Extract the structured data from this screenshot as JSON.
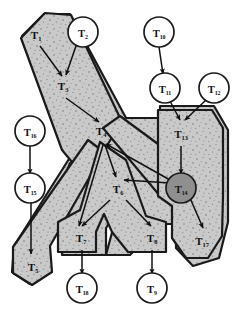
{
  "figure": {
    "type": "node-link-diagram",
    "colors": {
      "polygon_fill": "#c9c9c9",
      "polygon_stroke": "#1a1a1a",
      "highlight_node_fill": "#8f8f8f",
      "circle_fill": "#ffffff",
      "circle_stroke": "#1a1a1a",
      "arrow": "#111111",
      "background": "#ffffff"
    }
  },
  "nodes": [
    {
      "id": "T1",
      "base": "T",
      "sub": "1",
      "kind": "polygon-label",
      "x": 36,
      "y": 34
    },
    {
      "id": "T2",
      "base": "T",
      "sub": "2",
      "kind": "circle",
      "x": 83,
      "y": 32,
      "r": 15
    },
    {
      "id": "T3",
      "base": "T",
      "sub": "3",
      "kind": "polygon-label",
      "x": 63,
      "y": 85
    },
    {
      "id": "T4",
      "base": "T",
      "sub": "4",
      "kind": "polygon-label",
      "x": 101,
      "y": 130
    },
    {
      "id": "T5",
      "base": "T",
      "sub": "5",
      "kind": "polygon-label",
      "x": 33,
      "y": 266
    },
    {
      "id": "T6",
      "base": "T",
      "sub": "6",
      "kind": "polygon-label",
      "x": 118,
      "y": 188
    },
    {
      "id": "T7",
      "base": "T",
      "sub": "7",
      "kind": "polygon-label",
      "x": 81,
      "y": 237
    },
    {
      "id": "T8",
      "base": "T",
      "sub": "8",
      "kind": "polygon-label",
      "x": 152,
      "y": 237
    },
    {
      "id": "T9",
      "base": "T",
      "sub": "9",
      "kind": "circle",
      "x": 152,
      "y": 288,
      "r": 15
    },
    {
      "id": "T10",
      "base": "T",
      "sub": "10",
      "kind": "circle",
      "x": 159,
      "y": 32,
      "r": 15
    },
    {
      "id": "T11",
      "base": "T",
      "sub": "11",
      "kind": "circle",
      "x": 165,
      "y": 88,
      "r": 15
    },
    {
      "id": "T12",
      "base": "T",
      "sub": "12",
      "kind": "circle",
      "x": 214,
      "y": 88,
      "r": 15
    },
    {
      "id": "T13",
      "base": "T",
      "sub": "13",
      "kind": "polygon-label",
      "x": 181,
      "y": 133
    },
    {
      "id": "T14",
      "base": "T",
      "sub": "14",
      "kind": "circle-filled",
      "x": 181,
      "y": 188,
      "r": 15
    },
    {
      "id": "T15",
      "base": "T",
      "sub": "15",
      "kind": "circle",
      "x": 30,
      "y": 188,
      "r": 15
    },
    {
      "id": "T16",
      "base": "T",
      "sub": "16",
      "kind": "circle",
      "x": 30,
      "y": 131,
      "r": 15
    },
    {
      "id": "T17",
      "base": "T",
      "sub": "17",
      "kind": "polygon-label",
      "x": 202,
      "y": 240
    },
    {
      "id": "T18",
      "base": "T",
      "sub": "18",
      "kind": "circle",
      "x": 82,
      "y": 288,
      "r": 15
    }
  ],
  "arrows": [
    {
      "from": "T1",
      "to": "T3",
      "x1": 40,
      "y1": 46,
      "x2": 62,
      "y2": 76
    },
    {
      "from": "T2",
      "to": "T3",
      "x1": 76,
      "y1": 46,
      "x2": 66,
      "y2": 75
    },
    {
      "from": "T3",
      "to": "T4",
      "x1": 66,
      "y1": 98,
      "x2": 99,
      "y2": 122
    },
    {
      "from": "T10",
      "to": "T11",
      "x1": 159,
      "y1": 47,
      "x2": 163,
      "y2": 74
    },
    {
      "from": "T11",
      "to": "T13",
      "x1": 170,
      "y1": 101,
      "x2": 180,
      "y2": 120
    },
    {
      "from": "T12",
      "to": "T13",
      "x1": 206,
      "y1": 100,
      "x2": 185,
      "y2": 120
    },
    {
      "from": "T13",
      "to": "T14",
      "x1": 181,
      "y1": 146,
      "x2": 181,
      "y2": 174
    },
    {
      "from": "T14",
      "to": "T17",
      "x1": 190,
      "y1": 198,
      "x2": 203,
      "y2": 228
    },
    {
      "from": "T16",
      "to": "T15",
      "x1": 30,
      "y1": 146,
      "x2": 30,
      "y2": 174
    },
    {
      "from": "T15",
      "to": "T5",
      "x1": 31,
      "y1": 202,
      "x2": 31,
      "y2": 254
    },
    {
      "from": "T4",
      "to": "T6",
      "x1": 105,
      "y1": 145,
      "x2": 116,
      "y2": 177
    },
    {
      "from": "T4",
      "to": "T7",
      "x1": 103,
      "y1": 145,
      "x2": 79,
      "y2": 226
    },
    {
      "from": "T6",
      "to": "T7",
      "x1": 110,
      "y1": 200,
      "x2": 82,
      "y2": 226
    },
    {
      "from": "T6",
      "to": "T8",
      "x1": 126,
      "y1": 200,
      "x2": 151,
      "y2": 226
    },
    {
      "from": "T14",
      "to": "T4",
      "x1": 170,
      "y1": 180,
      "x2": 106,
      "y2": 144
    },
    {
      "from": "T14",
      "to": "T6",
      "x1": 170,
      "y1": 183,
      "x2": 124,
      "y2": 180
    },
    {
      "from": "T7",
      "to": "T18",
      "x1": 82,
      "y1": 250,
      "x2": 82,
      "y2": 274
    },
    {
      "from": "T8",
      "to": "T9",
      "x1": 152,
      "y1": 250,
      "x2": 152,
      "y2": 274
    }
  ]
}
